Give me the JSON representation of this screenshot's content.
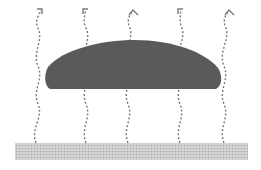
{
  "diagram": {
    "colors": {
      "background": "#ffffff",
      "cloud": "#5a5a5a",
      "arrow": "#7a7a7a",
      "ground_fill": "#d4d4d4",
      "ground_dot": "#a8a8a8"
    },
    "ground": {
      "x": 15,
      "y": 143,
      "width": 233,
      "height": 17
    },
    "cloud": {
      "x_min": 45,
      "x_max": 221,
      "y_top": 40,
      "y_bottom": 89
    },
    "arrows": [
      {
        "x_base": 37,
        "head": "angled"
      },
      {
        "x_base": 85,
        "head": "angled"
      },
      {
        "x_base": 131,
        "head": "caret"
      },
      {
        "x_base": 180,
        "head": "angled"
      },
      {
        "x_base": 227,
        "head": "caret"
      }
    ]
  }
}
